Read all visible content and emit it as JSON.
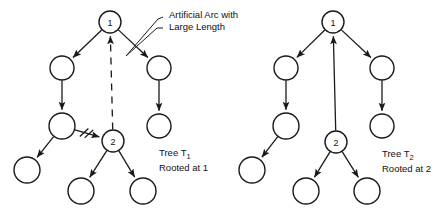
{
  "figure": {
    "background_color": "#ffffff",
    "ink_color": "#1a1a1a"
  },
  "annotations": [
    {
      "id": "artificial-arc-note",
      "line1": "Artificial Arc with",
      "line2": "Large Length"
    }
  ],
  "captions": [
    {
      "id": "tree-t1-caption",
      "line1_prefix": "Tree T",
      "line1_sub": "1",
      "line2": "Rooted at 1"
    },
    {
      "id": "tree-t2-caption",
      "line1_prefix": "Tree T",
      "line1_sub": "2",
      "line2": "Rooted at 2"
    }
  ],
  "trees": [
    {
      "id": "tree-t1",
      "root_label": "1",
      "nodes": [
        {
          "id": "t1-n1",
          "label": "1",
          "cx": 110,
          "cy": 22,
          "r": 11
        },
        {
          "id": "t1-n2",
          "label": "",
          "cx": 62,
          "cy": 68,
          "r": 12
        },
        {
          "id": "t1-n3",
          "label": "",
          "cx": 159,
          "cy": 68,
          "r": 12
        },
        {
          "id": "t1-n4",
          "label": "",
          "cx": 62,
          "cy": 126,
          "r": 13
        },
        {
          "id": "t1-n5",
          "label": "",
          "cx": 159,
          "cy": 126,
          "r": 12
        },
        {
          "id": "t1-n6",
          "label": "2",
          "cx": 113,
          "cy": 141,
          "r": 11
        },
        {
          "id": "t1-n7",
          "label": "",
          "cx": 27,
          "cy": 170,
          "r": 13
        },
        {
          "id": "t1-n8",
          "label": "",
          "cx": 81,
          "cy": 191,
          "r": 13
        },
        {
          "id": "t1-n9",
          "label": "",
          "cx": 143,
          "cy": 191,
          "r": 13
        }
      ],
      "arcs": [
        {
          "from": "t1-n1",
          "to": "t1-n2",
          "style": "solid",
          "arrow": true
        },
        {
          "from": "t1-n1",
          "to": "t1-n3",
          "style": "solid",
          "arrow": true
        },
        {
          "from": "t1-n2",
          "to": "t1-n4",
          "style": "solid",
          "arrow": true
        },
        {
          "from": "t1-n3",
          "to": "t1-n5",
          "style": "solid",
          "arrow": true
        },
        {
          "from": "t1-n4",
          "to": "t1-n7",
          "style": "solid",
          "arrow": true
        },
        {
          "from": "t1-n4",
          "to": "t1-n6",
          "style": "solid",
          "arrow": true,
          "cut": true
        },
        {
          "from": "t1-n6",
          "to": "t1-n8",
          "style": "solid",
          "arrow": true
        },
        {
          "from": "t1-n6",
          "to": "t1-n9",
          "style": "solid",
          "arrow": true
        },
        {
          "from": "t1-n6",
          "to": "t1-n1",
          "style": "dashed",
          "arrow": true,
          "artificial": true
        }
      ]
    },
    {
      "id": "tree-t2",
      "root_label": "1",
      "nodes": [
        {
          "id": "t2-n1",
          "label": "1",
          "cx": 333,
          "cy": 22,
          "r": 11
        },
        {
          "id": "t2-n2",
          "label": "",
          "cx": 286,
          "cy": 68,
          "r": 12
        },
        {
          "id": "t2-n3",
          "label": "",
          "cx": 382,
          "cy": 68,
          "r": 12
        },
        {
          "id": "t2-n4",
          "label": "",
          "cx": 286,
          "cy": 126,
          "r": 13
        },
        {
          "id": "t2-n5",
          "label": "",
          "cx": 382,
          "cy": 126,
          "r": 12
        },
        {
          "id": "t2-n6",
          "label": "2",
          "cx": 336,
          "cy": 142,
          "r": 11
        },
        {
          "id": "t2-n7",
          "label": "",
          "cx": 252,
          "cy": 170,
          "r": 13
        },
        {
          "id": "t2-n8",
          "label": "",
          "cx": 306,
          "cy": 191,
          "r": 13
        },
        {
          "id": "t2-n9",
          "label": "",
          "cx": 367,
          "cy": 191,
          "r": 13
        }
      ],
      "arcs": [
        {
          "from": "t2-n1",
          "to": "t2-n2",
          "style": "solid",
          "arrow": true
        },
        {
          "from": "t2-n1",
          "to": "t2-n3",
          "style": "solid",
          "arrow": true
        },
        {
          "from": "t2-n2",
          "to": "t2-n4",
          "style": "solid",
          "arrow": true
        },
        {
          "from": "t2-n3",
          "to": "t2-n5",
          "style": "solid",
          "arrow": true
        },
        {
          "from": "t2-n4",
          "to": "t2-n7",
          "style": "solid",
          "arrow": true
        },
        {
          "from": "t2-n6",
          "to": "t2-n1",
          "style": "solid",
          "arrow": true,
          "artificial": true
        },
        {
          "from": "t2-n6",
          "to": "t2-n8",
          "style": "solid",
          "arrow": true
        },
        {
          "from": "t2-n6",
          "to": "t2-n9",
          "style": "solid",
          "arrow": true
        }
      ]
    }
  ]
}
